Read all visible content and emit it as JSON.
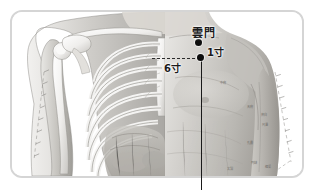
{
  "figure": {
    "type": "anatomical-acupuncture-chart",
    "frame_color": "#d5d5d5",
    "background_color": "#ffffff",
    "ink_color": "#1a1a1a"
  },
  "annotations": {
    "acupoint_label": "雲門",
    "measure_1": "1寸",
    "measure_2": "6寸",
    "points": [
      {
        "name": "yunmen-point",
        "label": "雲門"
      },
      {
        "name": "zhongfu-point",
        "label": ""
      }
    ]
  },
  "surface_marks": [
    "中府",
    "天府",
    "俠白",
    "尺澤",
    "孔最",
    "列缺",
    "經渠",
    "太淵",
    "魚際",
    "少商"
  ],
  "scales": {
    "left_ruler": "cun-scale-left-arm",
    "right_ruler": "cun-scale-right-arm"
  }
}
